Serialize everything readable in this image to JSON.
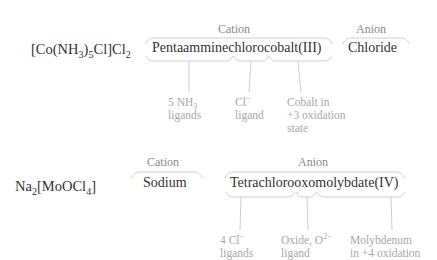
{
  "examples": [
    {
      "formula": {
        "base": "[Co(NH",
        "sub1": "3",
        "mid": ")",
        "sub2": "5",
        "rest": "Cl]Cl",
        "sub3": "2"
      },
      "groups": [
        {
          "label": "Cation",
          "name": "Pentaamminechlorocobalt(III)"
        },
        {
          "label": "Anion",
          "name": "Chloride"
        }
      ],
      "segments": [
        "Pentaammine",
        "chloro",
        "cobalt(III)"
      ],
      "notes": [
        {
          "line1_a": "5 NH",
          "line1_sub": "3",
          "line2": "ligands"
        },
        {
          "line1_a": "Cl",
          "line1_sup": "−",
          "line2": "ligand"
        },
        {
          "line1_a": "Cobalt in",
          "line2": "+3 oxidation",
          "line3": "state"
        }
      ]
    },
    {
      "formula": {
        "base": "Na",
        "sub1": "2",
        "rest": "[MoOCl",
        "sub2": "4",
        "end": "]"
      },
      "groups": [
        {
          "label": "Cation",
          "name": "Sodium"
        },
        {
          "label": "Anion",
          "name": "Tetrachlorooxomolybdate(IV)"
        }
      ],
      "segments": [
        "Tetrachloro",
        "oxo",
        "molybdate(IV)"
      ],
      "notes": [
        {
          "line1_a": "4 Cl",
          "line1_sup": "−",
          "line2": "ligands"
        },
        {
          "line1_a": "Oxide, O",
          "line1_sup": "2−",
          "line2": "ligand"
        },
        {
          "line1_a": "Molybdenum",
          "line2": "in +4 oxidation"
        }
      ]
    }
  ]
}
